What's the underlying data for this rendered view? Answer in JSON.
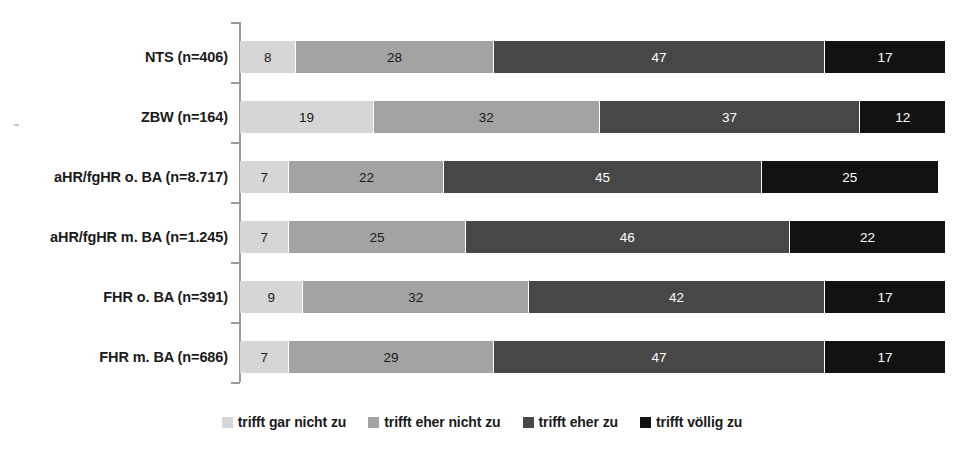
{
  "chart_data": {
    "type": "bar",
    "orientation": "horizontal",
    "stacked": true,
    "stack_total": 100,
    "title": "",
    "subtitle": "",
    "xlabel": "",
    "ylabel": "",
    "xlim": [
      0,
      100
    ],
    "grid": false,
    "legend_position": "bottom",
    "value_unit": "percent",
    "categories": [
      "NTS (n=406)",
      "ZBW (n=164)",
      "aHR/fgHR o. BA (n=8.717)",
      "aHR/fgHR m. BA (n=1.245)",
      "FHR o. BA (n=391)",
      "FHR m. BA (n=686)"
    ],
    "series": [
      {
        "name": "trifft gar nicht zu",
        "color": "#d6d6d6",
        "values": [
          8,
          19,
          7,
          7,
          9,
          7
        ]
      },
      {
        "name": "trifft eher nicht zu",
        "color": "#a3a3a3",
        "values": [
          28,
          32,
          22,
          25,
          32,
          29
        ]
      },
      {
        "name": "trifft eher zu",
        "color": "#474747",
        "values": [
          47,
          37,
          45,
          46,
          42,
          47
        ]
      },
      {
        "name": "trifft völlig zu",
        "color": "#121212",
        "values": [
          17,
          12,
          25,
          22,
          17,
          17
        ]
      }
    ]
  },
  "legend": {
    "items": [
      {
        "label": "trifft gar nicht zu",
        "color": "#d6d6d6",
        "swatch": "legend-swatch-icon"
      },
      {
        "label": "trifft eher nicht zu",
        "color": "#a3a3a3",
        "swatch": "legend-swatch-icon"
      },
      {
        "label": "trifft eher zu",
        "color": "#474747",
        "swatch": "legend-swatch-icon"
      },
      {
        "label": "trifft völlig zu",
        "color": "#121212",
        "swatch": "legend-swatch-icon"
      }
    ]
  }
}
